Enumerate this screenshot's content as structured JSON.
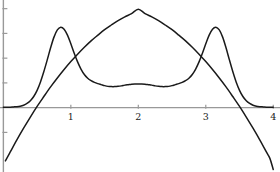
{
  "chart_data": {
    "type": "line",
    "title": "",
    "xlabel": "",
    "ylabel": "",
    "xlim": [
      -0.05,
      4.1
    ],
    "ylim": [
      -2.6,
      4.35
    ],
    "grid": false,
    "legend": "none",
    "axis_color": "#999999",
    "curve_color": "#1a1a1a",
    "background": "#ffffff",
    "xticks": [
      {
        "value": 1,
        "label": "1"
      },
      {
        "value": 2,
        "label": "2"
      },
      {
        "value": 3,
        "label": "3"
      },
      {
        "value": 4,
        "label": "4"
      }
    ],
    "yticks": [
      {
        "value": -1,
        "label": "-1"
      },
      {
        "value": 1,
        "label": "1"
      },
      {
        "value": 2,
        "label": "2"
      },
      {
        "value": 3,
        "label": "3"
      },
      {
        "value": 4,
        "label": "4"
      }
    ],
    "series": [
      {
        "name": "bimodal-curve",
        "description": "double-peaked curve, peaks 3.25 at x=0.85 and x=3.15, local max 0.95 at x=2, tails near 0 at x=0 and x=4",
        "points": [
          [
            0.0,
            0.02
          ],
          [
            0.05,
            0.02
          ],
          [
            0.1,
            0.02
          ],
          [
            0.15,
            0.03
          ],
          [
            0.2,
            0.04
          ],
          [
            0.25,
            0.06
          ],
          [
            0.3,
            0.1
          ],
          [
            0.35,
            0.17
          ],
          [
            0.4,
            0.28
          ],
          [
            0.45,
            0.45
          ],
          [
            0.5,
            0.7
          ],
          [
            0.55,
            1.04
          ],
          [
            0.6,
            1.46
          ],
          [
            0.65,
            1.93
          ],
          [
            0.7,
            2.42
          ],
          [
            0.75,
            2.85
          ],
          [
            0.8,
            3.14
          ],
          [
            0.85,
            3.25
          ],
          [
            0.9,
            3.17
          ],
          [
            0.95,
            2.93
          ],
          [
            1.0,
            2.58
          ],
          [
            1.05,
            2.2
          ],
          [
            1.1,
            1.85
          ],
          [
            1.15,
            1.56
          ],
          [
            1.2,
            1.34
          ],
          [
            1.25,
            1.19
          ],
          [
            1.3,
            1.09
          ],
          [
            1.35,
            1.02
          ],
          [
            1.4,
            0.97
          ],
          [
            1.45,
            0.93
          ],
          [
            1.5,
            0.89
          ],
          [
            1.55,
            0.86
          ],
          [
            1.6,
            0.85
          ],
          [
            1.65,
            0.85
          ],
          [
            1.7,
            0.86
          ],
          [
            1.75,
            0.88
          ],
          [
            1.8,
            0.91
          ],
          [
            1.85,
            0.93
          ],
          [
            1.9,
            0.95
          ],
          [
            1.95,
            0.96
          ],
          [
            2.0,
            0.96
          ],
          [
            2.05,
            0.96
          ],
          [
            2.1,
            0.95
          ],
          [
            2.15,
            0.93
          ],
          [
            2.2,
            0.91
          ],
          [
            2.25,
            0.88
          ],
          [
            2.3,
            0.86
          ],
          [
            2.35,
            0.85
          ],
          [
            2.4,
            0.85
          ],
          [
            2.45,
            0.86
          ],
          [
            2.5,
            0.89
          ],
          [
            2.55,
            0.93
          ],
          [
            2.6,
            0.97
          ],
          [
            2.65,
            1.02
          ],
          [
            2.7,
            1.09
          ],
          [
            2.75,
            1.19
          ],
          [
            2.8,
            1.34
          ],
          [
            2.85,
            1.56
          ],
          [
            2.9,
            1.85
          ],
          [
            2.95,
            2.2
          ],
          [
            3.0,
            2.58
          ],
          [
            3.05,
            2.93
          ],
          [
            3.1,
            3.17
          ],
          [
            3.15,
            3.25
          ],
          [
            3.2,
            3.14
          ],
          [
            3.25,
            2.85
          ],
          [
            3.3,
            2.42
          ],
          [
            3.35,
            1.93
          ],
          [
            3.4,
            1.46
          ],
          [
            3.45,
            1.04
          ],
          [
            3.5,
            0.7
          ],
          [
            3.55,
            0.45
          ],
          [
            3.6,
            0.28
          ],
          [
            3.65,
            0.17
          ],
          [
            3.7,
            0.1
          ],
          [
            3.75,
            0.06
          ],
          [
            3.8,
            0.04
          ],
          [
            3.85,
            0.03
          ],
          [
            3.9,
            0.02
          ],
          [
            3.95,
            0.02
          ],
          [
            4.0,
            0.02
          ]
        ]
      },
      {
        "name": "dome-curve",
        "description": "downward parabola peaking at 4.0 at x=2, crossing zero near x=0.33 and x=3.67",
        "points": [
          [
            0.03,
            -2.15
          ],
          [
            0.1,
            -1.8
          ],
          [
            0.2,
            -1.3
          ],
          [
            0.3,
            -0.83
          ],
          [
            0.4,
            -0.38
          ],
          [
            0.5,
            0.05
          ],
          [
            0.6,
            0.45
          ],
          [
            0.7,
            0.84
          ],
          [
            0.8,
            1.2
          ],
          [
            0.9,
            1.54
          ],
          [
            1.0,
            1.86
          ],
          [
            1.1,
            2.16
          ],
          [
            1.2,
            2.44
          ],
          [
            1.3,
            2.7
          ],
          [
            1.4,
            2.93
          ],
          [
            1.5,
            3.15
          ],
          [
            1.6,
            3.34
          ],
          [
            1.7,
            3.52
          ],
          [
            1.8,
            3.67
          ],
          [
            1.9,
            3.8
          ],
          [
            2.0,
            3.98
          ],
          [
            2.1,
            3.8
          ],
          [
            2.2,
            3.67
          ],
          [
            2.3,
            3.52
          ],
          [
            2.4,
            3.34
          ],
          [
            2.5,
            3.15
          ],
          [
            2.6,
            2.93
          ],
          [
            2.7,
            2.7
          ],
          [
            2.8,
            2.44
          ],
          [
            2.9,
            2.16
          ],
          [
            3.0,
            1.86
          ],
          [
            3.1,
            1.54
          ],
          [
            3.2,
            1.2
          ],
          [
            3.3,
            0.84
          ],
          [
            3.4,
            0.45
          ],
          [
            3.5,
            0.05
          ],
          [
            3.6,
            -0.38
          ],
          [
            3.7,
            -0.83
          ],
          [
            3.8,
            -1.3
          ],
          [
            3.9,
            -1.8
          ],
          [
            3.95,
            -2.05
          ],
          [
            4.0,
            -2.5
          ]
        ]
      }
    ]
  }
}
